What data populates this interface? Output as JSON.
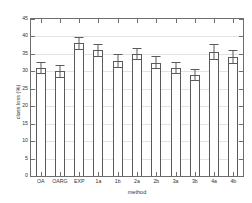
{
  "chart_data": {
    "type": "bar",
    "title": "",
    "xlabel": "method",
    "ylabel": "class loss (%)",
    "categories": [
      "OA",
      "OARG",
      "EXP",
      "1a",
      "1b",
      "2a",
      "2b",
      "3a",
      "3b",
      "4a",
      "4b"
    ],
    "values": [
      31.0,
      30.0,
      38.0,
      36.0,
      33.0,
      35.0,
      32.5,
      31.0,
      29.0,
      35.5,
      34.0
    ],
    "errors": [
      1.8,
      1.8,
      1.8,
      1.8,
      2.0,
      1.8,
      1.8,
      1.8,
      1.8,
      2.2,
      2.0
    ],
    "series": [
      {
        "name": "class loss",
        "values": [
          31.0,
          30.0,
          38.0,
          36.0,
          33.0,
          35.0,
          32.5,
          31.0,
          29.0,
          35.5,
          34.0
        ],
        "errors": [
          1.8,
          1.8,
          1.8,
          1.8,
          2.0,
          1.8,
          1.8,
          1.8,
          1.8,
          2.2,
          2.0
        ]
      }
    ],
    "ylim": [
      0,
      45
    ],
    "yticks": [
      0,
      5,
      10,
      15,
      20,
      25,
      30,
      35,
      40,
      45
    ],
    "ytick_labels": [
      "0",
      "5",
      "10",
      "15",
      "20",
      "25",
      "30",
      "35",
      "40",
      "45"
    ],
    "grid": true,
    "grid_axis": "y",
    "legend": null,
    "bar_facecolor": "#ffffff",
    "bar_edgecolor": "#5a5a5a",
    "errorbar_color": "#5a5a5a",
    "axis_color": "#6e6e6e",
    "grid_color": "#e3e3e3",
    "background": "#ffffff"
  }
}
